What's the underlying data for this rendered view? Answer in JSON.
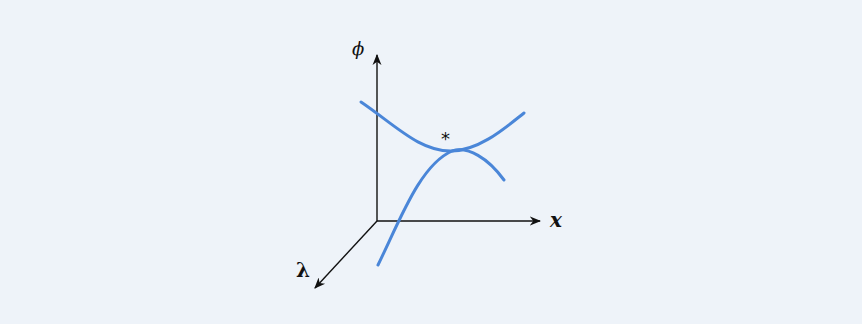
{
  "diagram": {
    "background": "#eef3f9",
    "curve_color": "#4a86d8",
    "axis_color": "#111111",
    "labels": {
      "phi_axis": "ϕ",
      "x_axis": "x",
      "lambda_axis": "λ",
      "critical_point": "*"
    }
  }
}
